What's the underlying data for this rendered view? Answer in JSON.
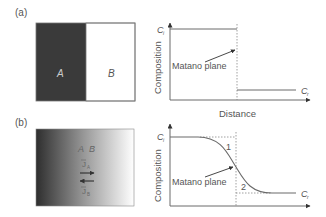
{
  "panels": [
    {
      "label": "(a)",
      "block": {
        "left_label": "A",
        "right_label": "B",
        "left_color": "#3a3a3a",
        "right_color": "#ffffff"
      },
      "chart": {
        "ylabel": "Composition",
        "xlabel": "Distance",
        "top_level_label": "C",
        "top_level_sub": "i",
        "bottom_level_label": "C",
        "bottom_level_sub": "r",
        "annotation": "Matano plane"
      }
    },
    {
      "label": "(b)",
      "block": {
        "left_label": "A",
        "right_label": "B",
        "flux_top": "J",
        "flux_top_sub": "A",
        "flux_bottom": "J",
        "flux_bottom_sub": "B"
      },
      "chart": {
        "ylabel": "Composition",
        "top_level_label": "C",
        "top_level_sub": "i",
        "bottom_level_label": "C",
        "bottom_level_sub": "r",
        "annotation": "Matano plane",
        "region_1": "1",
        "region_2": "2"
      }
    }
  ],
  "colors": {
    "line": "#6a6a6a",
    "dark": "#3a3a3a",
    "text": "#555555"
  }
}
